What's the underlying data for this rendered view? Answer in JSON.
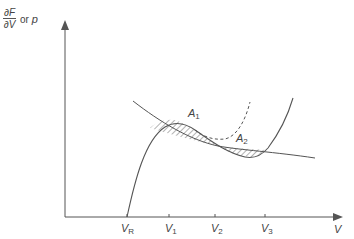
{
  "diagram": {
    "y_axis_label": {
      "numerator": "∂F",
      "denominator": "∂V",
      "connector": "or",
      "alt": "p"
    },
    "x_axis_label": "V",
    "x_ticks": [
      {
        "label": "V",
        "sub": "R"
      },
      {
        "label": "V",
        "sub": "1"
      },
      {
        "label": "V",
        "sub": "2"
      },
      {
        "label": "V",
        "sub": "3"
      }
    ],
    "areas": [
      {
        "label": "A",
        "sub": "1"
      },
      {
        "label": "A",
        "sub": "2"
      }
    ],
    "curves": [
      "cubic-isotherm",
      "decreasing-curve",
      "dashed-metastable-branch"
    ],
    "colors": {
      "line": "#555555",
      "text": "#444444"
    }
  }
}
